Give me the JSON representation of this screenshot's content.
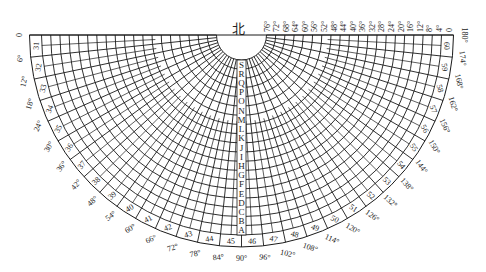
{
  "diagram": {
    "type": "polar-half-disc-grid",
    "north_label": "北",
    "center": {
      "x": 241.5,
      "y": 35
    },
    "inner_radius": 25,
    "band_inner_radius": 200,
    "band_outer_radius": 212,
    "label_radius": 223,
    "ring_letters": [
      "S",
      "R",
      "Q",
      "P",
      "O",
      "N",
      "M",
      "L",
      "K",
      "J",
      "I",
      "H",
      "G",
      "F",
      "E",
      "D",
      "C",
      "B",
      "A"
    ],
    "ring_numbers": [
      "31",
      "32",
      "33",
      "34",
      "35",
      "36",
      "37",
      "38",
      "39",
      "40",
      "41",
      "42",
      "43",
      "44",
      "45",
      "46",
      "47",
      "48",
      "49",
      "50",
      "51",
      "52",
      "53",
      "54",
      "55",
      "56",
      "57",
      "58",
      "59",
      "60"
    ],
    "azimuth_labels": [
      "0",
      "6°",
      "12°",
      "18°",
      "24°",
      "30°",
      "36°",
      "42°",
      "48°",
      "54°",
      "60°",
      "66°",
      "72°",
      "78°",
      "84°",
      "90°",
      "96°",
      "102°",
      "108°",
      "114°",
      "120°",
      "126°",
      "132°",
      "138°",
      "144°",
      "150°",
      "156°",
      "162°",
      "168°",
      "174°",
      "180°"
    ],
    "top_labels": [
      "76°",
      "72°",
      "68°",
      "64°",
      "60°",
      "56°",
      "52°",
      "48°",
      "44°",
      "40°",
      "36°",
      "32°",
      "28°",
      "24°",
      "20°",
      "16°",
      "12°",
      "8°",
      "4°",
      "0"
    ],
    "colors": {
      "line": "#1a1a1a",
      "text": "#222222",
      "background": "#ffffff"
    }
  }
}
